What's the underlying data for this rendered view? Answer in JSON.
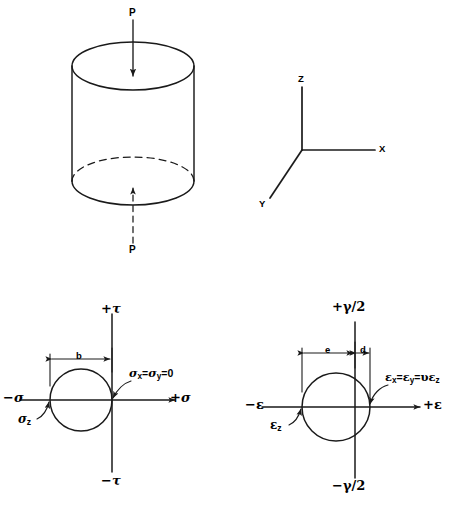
{
  "figure": {
    "title": "",
    "stroke_color": "#1a1a1a",
    "background": "#ffffff"
  },
  "cylinder": {
    "name": "uniaxial-compression-cylinder",
    "load_label_top": "P",
    "load_label_bottom": "P",
    "arrow_top_direction": "down",
    "arrow_bottom_direction": "up",
    "hidden_edge_style": "dashed"
  },
  "axes3d": {
    "name": "coordinate-axes",
    "z_label": "Z",
    "x_label": "X",
    "y_label": "Y"
  },
  "stress_circle": {
    "name": "mohr-circle-stress",
    "axis_top_label": "+τ",
    "axis_bottom_label": "−τ",
    "axis_left_label": "−σ",
    "axis_right_label": "+σ",
    "dimension_label": "b",
    "point_left_label": "σ",
    "point_left_sub": "z",
    "point_right_label": "σx=σy=0",
    "point_right_parts": {
      "s1": "σ",
      "sub1": "x",
      "eq1": "=",
      "s2": "σ",
      "sub2": "y",
      "eq2": "=0"
    }
  },
  "strain_circle": {
    "name": "mohr-circle-strain",
    "axis_top_label": "+γ/2",
    "axis_bottom_label": "−γ/2",
    "axis_left_label": "−ε",
    "axis_right_label": "+ε",
    "dimension_label_wide": "e",
    "dimension_label_narrow": "d",
    "point_left_label": "ε",
    "point_left_sub": "z",
    "point_right_label": "εx=εy=υεz",
    "point_right_parts": {
      "e1": "ε",
      "sub1": "x",
      "eq1": "=",
      "e2": "ε",
      "sub2": "y",
      "eq2": "=",
      "nu": "υ",
      "e3": "ε",
      "sub3": "z"
    }
  }
}
